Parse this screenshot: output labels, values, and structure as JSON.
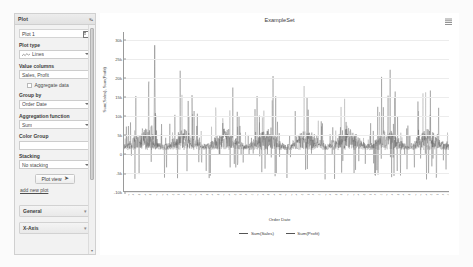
{
  "sidebar": {
    "header": {
      "title": "Plot",
      "collapse_icon": "chevron-down-icon"
    },
    "plot_name": {
      "value": "Plot 1",
      "icon": "table-icon"
    },
    "plot_type": {
      "label": "Plot type",
      "value": "Lines",
      "icon": "line-chart-icon"
    },
    "value_columns": {
      "label": "Value columns",
      "value": "Sales, Profit"
    },
    "aggregate": {
      "label": "Aggregate data",
      "checked": false
    },
    "group_by": {
      "label": "Group by",
      "value": "Order Date"
    },
    "aggregation_function": {
      "label": "Aggregation function",
      "value": "Sum"
    },
    "color_group": {
      "label": "Color Group",
      "value": "",
      "placeholder": ""
    },
    "stacking": {
      "label": "Stacking",
      "value": "No stacking"
    },
    "plot_view_button": {
      "label": "Plot view",
      "icon": "arrow-right-icon"
    },
    "add_new_plot_link": "add new plot",
    "sections": [
      {
        "label": "General",
        "expand_icon": "chevron-down-icon"
      },
      {
        "label": "X-Axis",
        "expand_icon": "chevron-down-icon"
      }
    ],
    "scrollbar": {
      "up_icon": "caret-up-icon",
      "down_icon": "caret-down-icon"
    }
  },
  "chart_panel": {
    "menu_icon": "grid-menu-icon"
  },
  "chart_data": {
    "type": "line",
    "title": "ExampleSet",
    "xlabel": "Order Date",
    "ylabel": "Sum(Sales), Sum(Profit)",
    "ylim": [
      -10000,
      32000
    ],
    "yticks": [
      30000,
      25000,
      20000,
      15000,
      10000,
      5000,
      0,
      -5000,
      -10000
    ],
    "ytick_labels": [
      "30k",
      "25k",
      "20k",
      "15k",
      "10k",
      "5k",
      "0",
      "-5k",
      "-10k"
    ],
    "grid": true,
    "legend_position": "bottom",
    "x_tick_labels": [
      "Jan 1 2014",
      "Feb 3 2014",
      "Mar 6 2014",
      "Apr 7 2014",
      "May 9 2014",
      "Jun 10 2014",
      "Jul 13 2014",
      "Aug 14 2014",
      "Sep 15 2014",
      "Oct 17 2014",
      "Nov 18 2014",
      "Dec 20 2014",
      "Jan 22 2015",
      "Feb 23 2015",
      "Mar 26 2015",
      "Apr 27 2015",
      "May 29 2015",
      "Jun 30 2015",
      "Aug 1 2015",
      "Sep 2 2015",
      "Oct 4 2015",
      "Nov 5 2015",
      "Dec 7 2015",
      "Jan 8 2016",
      "Feb 9 2016",
      "Mar 12 2016",
      "Apr 13 2016",
      "May 15 2016",
      "Jun 16 2016",
      "Jul 18 2016",
      "Aug 19 2016",
      "Sep 20 2016",
      "Oct 22 2016",
      "Nov 23 2016",
      "Dec 25 2016",
      "Jan 26 2017",
      "Feb 27 2017",
      "Mar 31 2017",
      "May 2 2017",
      "Jun 3 2017",
      "Jul 5 2017",
      "Aug 6 2017",
      "Sep 7 2017",
      "Oct 9 2017",
      "Nov 10 2017",
      "Dec 12 2017",
      "Jan 13 2018",
      "Feb 14 2018",
      "Mar 18 2018",
      "Apr 19 2018",
      "May 21 2018",
      "Jun 22 2018",
      "Jul 24 2018",
      "Aug 25 2018",
      "Sep 26 2018",
      "Oct 28 2018",
      "Nov 29 2018",
      "Dec 30 2018"
    ],
    "series": [
      {
        "name": "Sum(Sales)",
        "color": "#555555"
      },
      {
        "name": "Sum(Profit)",
        "color": "#8a8a8a"
      }
    ],
    "notable_points": [
      {
        "label": "peak",
        "value": 28500
      },
      {
        "label": "typical_high",
        "value": 12000
      },
      {
        "label": "baseline",
        "value": 1500
      },
      {
        "label": "min",
        "value": -6500
      }
    ]
  }
}
